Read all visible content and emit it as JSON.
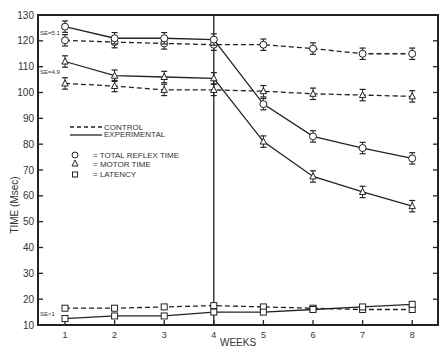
{
  "chart_data": {
    "type": "line",
    "title": "",
    "xlabel": "WEEKS",
    "ylabel": "TIME (Msec)",
    "x": [
      1,
      2,
      3,
      4,
      5,
      6,
      7,
      8
    ],
    "xticks": [
      "1",
      "2",
      "3",
      "4",
      "5",
      "6",
      "7",
      "8"
    ],
    "yticks": [
      10,
      20,
      30,
      40,
      50,
      60,
      70,
      80,
      90,
      100,
      110,
      120,
      130
    ],
    "ylim": [
      10,
      130
    ],
    "xlim": [
      0.5,
      8.5
    ],
    "grid": false,
    "vertical_marker_x": 4,
    "legend": {
      "position": "upper-left inside",
      "line_styles": [
        {
          "style": "dashed",
          "label": "CONTROL"
        },
        {
          "style": "solid",
          "label": "EXPERIMENTAL"
        }
      ],
      "markers": [
        {
          "marker": "circle",
          "label": "= TOTAL REFLEX TIME"
        },
        {
          "marker": "triangle",
          "label": "= MOTOR TIME"
        },
        {
          "marker": "square",
          "label": "= LATENCY"
        }
      ]
    },
    "annotations": [
      {
        "text": "SE=5.1",
        "x": 1,
        "y": 122.5
      },
      {
        "text": "SE=4.9",
        "x": 1,
        "y": 108
      },
      {
        "text": "SE<1",
        "x": 1,
        "y": 14
      }
    ],
    "series": [
      {
        "name": "Control - Total Reflex Time",
        "group": "control",
        "measure": "total",
        "marker": "circle",
        "style": "dashed",
        "values": [
          120.2,
          119.5,
          119,
          118.5,
          118.5,
          117,
          115,
          115
        ],
        "error": 2.2
      },
      {
        "name": "Experimental - Total Reflex Time",
        "group": "experimental",
        "measure": "total",
        "marker": "circle",
        "style": "solid",
        "values": [
          125.5,
          121,
          121,
          120.5,
          95.5,
          83,
          78.5,
          74.5
        ],
        "error": 2.2
      },
      {
        "name": "Control - Motor Time",
        "group": "control",
        "measure": "motor",
        "marker": "triangle",
        "style": "dashed",
        "values": [
          103.5,
          102.5,
          101,
          101,
          100.5,
          99.5,
          99,
          98.5
        ],
        "error": 2.2
      },
      {
        "name": "Experimental - Motor Time",
        "group": "experimental",
        "measure": "motor",
        "marker": "triangle",
        "style": "solid",
        "values": [
          112,
          106.5,
          106,
          105.5,
          81,
          67.5,
          61.5,
          56
        ],
        "error": 2.2
      },
      {
        "name": "Control - Latency",
        "group": "control",
        "measure": "latency",
        "marker": "square",
        "style": "dashed",
        "values": [
          16.5,
          16.5,
          17,
          17.5,
          17,
          16.5,
          16,
          16
        ],
        "error": 0
      },
      {
        "name": "Experimental - Latency",
        "group": "experimental",
        "measure": "latency",
        "marker": "square",
        "style": "solid",
        "values": [
          12.5,
          13.5,
          13.5,
          15,
          15,
          16,
          17,
          18
        ],
        "error": 0
      }
    ]
  },
  "labels": {
    "xlabel": "WEEKS",
    "ylabel": "TIME (Msec)",
    "legend_control": "CONTROL",
    "legend_experimental": "EXPERIMENTAL",
    "legend_total": "= TOTAL REFLEX TIME",
    "legend_motor": "= MOTOR TIME",
    "legend_latency": "= LATENCY",
    "se_total": "SE=5.1",
    "se_motor": "SE=4.9",
    "se_latency": "SE<1"
  }
}
